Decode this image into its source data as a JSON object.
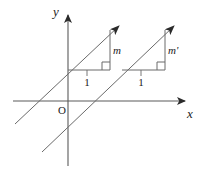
{
  "figure": {
    "background_color": "#ffffff",
    "stroke_color": "#555555",
    "axis_color": "#5a5a5a",
    "text_color": "#1a1a1a",
    "axes": {
      "y_axis_label": "y",
      "x_axis_label": "x",
      "origin_label": "O",
      "y_axis": {
        "x": 68,
        "y_top": 12,
        "y_bottom": 166,
        "arrow": "up"
      },
      "x_axis": {
        "y": 101,
        "x_left": 13,
        "x_right": 188,
        "arrow": "right"
      }
    },
    "lines": [
      {
        "name": "line-m",
        "label": "m",
        "slope_label": "m",
        "run_label": "1",
        "arrow": "up-right",
        "start": {
          "x": 15,
          "y": 124
        },
        "end": {
          "x": 122,
          "y": 24
        },
        "triangle": {
          "vertex_left": {
            "x": 68,
            "y": 70
          },
          "vertex_right": {
            "x": 110,
            "y": 70
          },
          "vertex_top": {
            "x": 110,
            "y": 30
          },
          "right_angle_marker": {
            "x": 102,
            "y": 62,
            "size": 8
          }
        },
        "slope_label_pos": {
          "x": 113,
          "y": 52
        },
        "run_label_pos": {
          "x": 87,
          "y": 82
        }
      },
      {
        "name": "line-m-prime",
        "label": "m'",
        "slope_label": "m'",
        "run_label": "1",
        "arrow": "up-right",
        "start": {
          "x": 42,
          "y": 152
        },
        "end": {
          "x": 177,
          "y": 24
        },
        "triangle": {
          "vertex_left": {
            "x": 122,
            "y": 70
          },
          "vertex_right": {
            "x": 165,
            "y": 70
          },
          "vertex_top": {
            "x": 165,
            "y": 30
          },
          "right_angle_marker": {
            "x": 157,
            "y": 62,
            "size": 8
          }
        },
        "slope_label_pos": {
          "x": 168,
          "y": 52
        },
        "run_label_pos": {
          "x": 141,
          "y": 82
        }
      }
    ]
  }
}
